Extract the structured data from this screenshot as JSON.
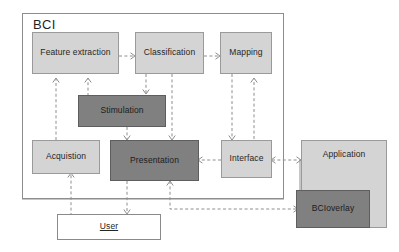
{
  "diagram": {
    "title": "BCI",
    "container_label": "BCI",
    "colors": {
      "light_box": "#d4d4d4",
      "dark_box": "#808080",
      "white_box": "#ffffff",
      "border": "#8d8d8d",
      "connector": "#8e8e8e",
      "text": "#262626",
      "background": "#ffffff"
    },
    "nodes": [
      {
        "id": "feature_extraction",
        "label": "Feature extraction",
        "style": "light"
      },
      {
        "id": "classification",
        "label": "Classification",
        "style": "light"
      },
      {
        "id": "mapping",
        "label": "Mapping",
        "style": "light"
      },
      {
        "id": "stimulation",
        "label": "Stimulation",
        "style": "dark"
      },
      {
        "id": "acquistion",
        "label": "Acquistion",
        "style": "light"
      },
      {
        "id": "presentation",
        "label": "Presentation",
        "style": "dark"
      },
      {
        "id": "interface",
        "label": "Interface",
        "style": "light"
      },
      {
        "id": "application",
        "label": "Application",
        "style": "light"
      },
      {
        "id": "bcioverlay",
        "label": "BCIoverlay",
        "style": "dark"
      },
      {
        "id": "user",
        "label": "User",
        "style": "white"
      }
    ],
    "edges": [
      {
        "from": "feature_extraction",
        "to": "classification",
        "kind": "dashed-arrow"
      },
      {
        "from": "classification",
        "to": "mapping",
        "kind": "dashed-arrow"
      },
      {
        "from": "acquistion",
        "to": "feature_extraction",
        "kind": "dashed-arrow"
      },
      {
        "from": "stimulation",
        "to": "feature_extraction",
        "kind": "dashed-arrow"
      },
      {
        "from": "classification",
        "to": "stimulation",
        "kind": "dashed-arrow"
      },
      {
        "from": "classification",
        "to": "presentation",
        "kind": "dashed-arrow"
      },
      {
        "from": "stimulation",
        "to": "presentation",
        "kind": "dashed-arrow"
      },
      {
        "from": "mapping",
        "to": "interface",
        "kind": "dashed-arrow"
      },
      {
        "from": "interface",
        "to": "mapping",
        "kind": "dashed-arrow"
      },
      {
        "from": "interface",
        "to": "presentation",
        "kind": "dashed-arrow"
      },
      {
        "from": "application",
        "to": "interface",
        "kind": "dashed-arrow"
      },
      {
        "from": "interface",
        "to": "application",
        "kind": "dashed-arrow"
      },
      {
        "from": "user",
        "to": "acquistion",
        "kind": "dashed-arrow"
      },
      {
        "from": "presentation",
        "to": "user",
        "kind": "dashed-arrow"
      },
      {
        "from": "bcioverlay",
        "to": "presentation",
        "kind": "dashed-arrow"
      },
      {
        "from": "application",
        "to": "bcioverlay",
        "kind": "dashed-arrow"
      }
    ]
  }
}
